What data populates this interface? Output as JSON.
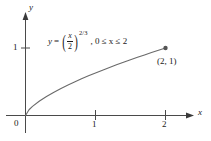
{
  "figure": {
    "background_color": "#ffffff",
    "stroke_color": "#4a4a4a",
    "text_color": "#1a1a1a"
  },
  "axes": {
    "x_axis_name": "x",
    "y_axis_name": "y",
    "origin_label": "0",
    "x_ticks": [
      "1",
      "2"
    ],
    "y_ticks": [
      "1"
    ]
  },
  "equation": {
    "lhs": "y",
    "equals": "=",
    "open_paren": "(",
    "close_paren": ")",
    "numerator": "x",
    "denominator": "2",
    "exponent": "2/3",
    "condition": ", 0 ≤ x ≤ 2"
  },
  "annotations": {
    "endpoint_label": "(2, 1)"
  },
  "chart_data": {
    "type": "line",
    "title": "",
    "xlabel": "x",
    "ylabel": "y",
    "equation": "y = (x/2)^(2/3)",
    "domain": [
      0,
      2
    ],
    "xlim": [
      0,
      2.35
    ],
    "ylim": [
      0,
      1.35
    ],
    "xticks": [
      1,
      2
    ],
    "yticks": [
      1
    ],
    "grid": false,
    "legend": "none",
    "endpoint": {
      "x": 2,
      "y": 1,
      "label": "(2, 1)",
      "marker": "filled-circle"
    },
    "x": [
      0,
      0.05,
      0.1,
      0.2,
      0.3,
      0.4,
      0.5,
      0.6,
      0.7,
      0.8,
      0.9,
      1.0,
      1.1,
      1.2,
      1.3,
      1.4,
      1.5,
      1.6,
      1.7,
      1.8,
      1.9,
      2.0
    ],
    "y": [
      0,
      0.0855,
      0.1357,
      0.2154,
      0.2823,
      0.342,
      0.3969,
      0.4481,
      0.4966,
      0.5429,
      0.5874,
      0.63,
      0.6714,
      0.7114,
      0.7503,
      0.7882,
      0.8255,
      0.8618,
      0.8974,
      0.9322,
      0.9664,
      1.0
    ]
  }
}
